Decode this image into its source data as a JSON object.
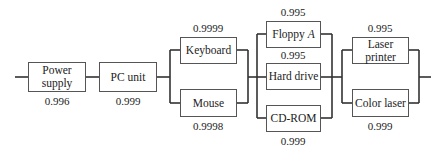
{
  "diagram": {
    "type": "reliability-block-diagram",
    "stages": [
      {
        "id": "power",
        "components": [
          {
            "label": "Power supply",
            "line1": "Power",
            "line2": "supply",
            "reliability": "0.996"
          }
        ]
      },
      {
        "id": "pc",
        "components": [
          {
            "label": "PC unit",
            "reliability": "0.999"
          }
        ]
      },
      {
        "id": "input",
        "parallel": true,
        "components": [
          {
            "label": "Keyboard",
            "reliability": "0.9999"
          },
          {
            "label": "Mouse",
            "reliability": "0.9998"
          }
        ]
      },
      {
        "id": "storage",
        "parallel": true,
        "components": [
          {
            "label": "Floppy",
            "label_italic": "A",
            "reliability": "0.995"
          },
          {
            "label": "Hard drive",
            "reliability": "0.995"
          },
          {
            "label": "CD-ROM",
            "reliability": "0.999"
          }
        ]
      },
      {
        "id": "printer",
        "parallel": true,
        "components": [
          {
            "label": "Laser printer",
            "reliability": "0.995"
          },
          {
            "label": "Color laser",
            "reliability": "0.999"
          }
        ]
      }
    ]
  },
  "colors": {
    "line": "#333333",
    "border": "#555555"
  }
}
